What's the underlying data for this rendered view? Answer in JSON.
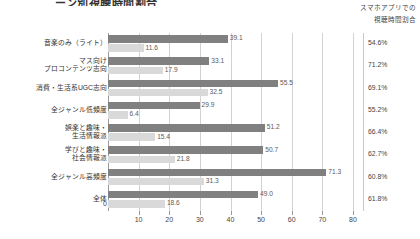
{
  "header": {
    "title_partial": "ーン別視聴時間割合",
    "right_caption": "スマホアプリでの\n視聴時間割合"
  },
  "axis": {
    "ticks": [
      0,
      10,
      20,
      30,
      40,
      50,
      60,
      70,
      80
    ],
    "min": 0,
    "max": 80
  },
  "colors": {
    "series_dark": "#808080",
    "series_light": "#d9d9d9",
    "grid": "#d2d2d2"
  },
  "chart_data": {
    "type": "bar",
    "title": "ーン別視聴時間割合",
    "xlabel": "",
    "ylabel": "",
    "xlim": [
      0,
      80
    ],
    "grid": true,
    "legend_position": "none",
    "orientation": "horizontal",
    "categories": [
      "音楽のみ（ライト）",
      "マス向け\nプロコンテンツ志向",
      "消費・生活系UGC志向",
      "全ジャンル低頻度",
      "娯楽と趣味・\n生活情報派",
      "学びと趣味・\n社会情報派",
      "全ジャンル高頻度",
      "全体"
    ],
    "series": [
      {
        "name": "series-dark",
        "values": [
          39.1,
          33.1,
          55.5,
          29.9,
          51.2,
          50.7,
          71.3,
          49.0
        ],
        "labels": [
          "39.1",
          "33.1",
          "55.5",
          "29.9",
          "51.2",
          "50.7",
          "71.3",
          "49.0"
        ]
      },
      {
        "name": "series-light",
        "values": [
          11.6,
          17.9,
          32.5,
          6.4,
          15.4,
          21.8,
          31.3,
          18.6
        ],
        "labels": [
          "11.6",
          "17.9",
          "32.5",
          "6.4",
          "15.4",
          "21.8",
          "31.3",
          "18.6"
        ]
      }
    ],
    "side_column": {
      "header": "スマホアプリでの\n視聴時間割合",
      "values": [
        "54.6%",
        "71.2%",
        "69.1%",
        "55.2%",
        "66.4%",
        "62.7%",
        "60.8%",
        "61.8%"
      ]
    }
  }
}
